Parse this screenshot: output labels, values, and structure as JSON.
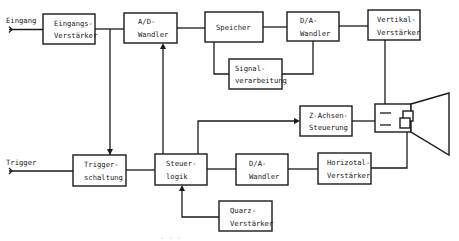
{
  "diagram": {
    "type": "block-diagram",
    "inputs": {
      "eingang": "Eingang",
      "trigger": "Trigger"
    },
    "blocks": {
      "eingangs_verstaerker": {
        "line1": "Eingangs-",
        "line2": "Verstärker"
      },
      "ad_wandler": {
        "line1": "A/D-",
        "line2": "Wandler"
      },
      "speicher": {
        "line1": "Speicher",
        "line2": ""
      },
      "da_wandler_top": {
        "line1": "D/A-",
        "line2": "Wandler"
      },
      "vertikal_verstaerker": {
        "line1": "Vertikal-",
        "line2": "Verstärker"
      },
      "signalverarbeitung": {
        "line1": "Signal-",
        "line2": "verarbeitung"
      },
      "z_achsen_steuerung": {
        "line1": "Z-Achsen-",
        "line2": "Steuerung"
      },
      "triggerschaltung": {
        "line1": "Trigger-",
        "line2": "schaltung"
      },
      "steuerlogik": {
        "line1": "Steuer-",
        "line2": "logik"
      },
      "da_wandler_bottom": {
        "line1": "D/A-",
        "line2": "Wandler"
      },
      "horizontal_verstaerker": {
        "line1": "Horizotal-",
        "line2": "Verstärker"
      },
      "quarz_verstaerker": {
        "line1": "Quarz-",
        "line2": "Verstärker"
      }
    },
    "output_device": "CRT display tube",
    "caption_fragment": "- - -"
  }
}
